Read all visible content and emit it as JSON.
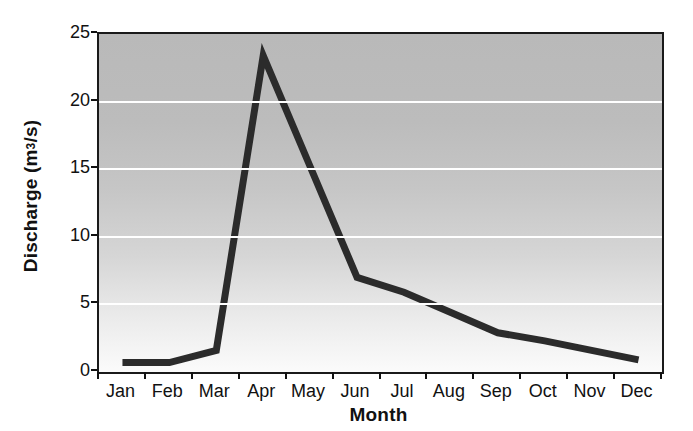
{
  "chart_data": {
    "type": "line",
    "title": "",
    "xlabel": "Month",
    "ylabel_text": "Discharge (m",
    "ylabel_sup": "3",
    "ylabel_tail": "/s)",
    "ylabel_full": "Discharge (m3/s)",
    "categories": [
      "Jan",
      "Feb",
      "Mar",
      "Apr",
      "May",
      "Jun",
      "Jul",
      "Aug",
      "Sep",
      "Oct",
      "Nov",
      "Dec"
    ],
    "values": [
      0.7,
      0.7,
      1.6,
      23.4,
      15.2,
      7.0,
      5.9,
      4.4,
      2.9,
      2.3,
      1.6,
      0.9
    ],
    "series": [
      {
        "name": "Discharge",
        "values": [
          0.7,
          0.7,
          1.6,
          23.4,
          15.2,
          7.0,
          5.9,
          4.4,
          2.9,
          2.3,
          1.6,
          0.9
        ],
        "color": "#2b2b2b"
      }
    ],
    "ylim": [
      0,
      25
    ],
    "yticks": [
      0,
      5,
      10,
      15,
      20,
      25
    ],
    "ytick_labels": [
      "0",
      "5",
      "10",
      "15",
      "20",
      "25"
    ],
    "grid": "horizontal-white",
    "legend": "none",
    "plot_background": "vertical gray gradient dark-top to white-bottom",
    "line_color": "#2b2b2b",
    "line_width_px": 7,
    "axis_color": "#1a1a1a"
  }
}
